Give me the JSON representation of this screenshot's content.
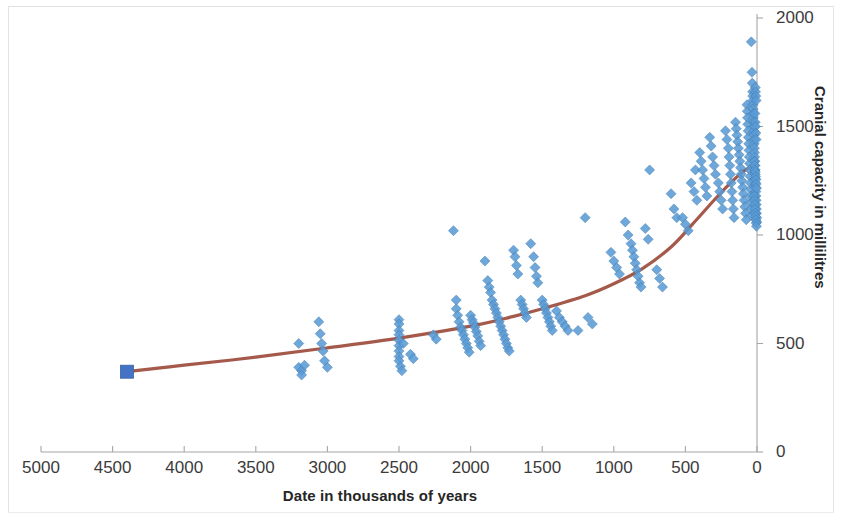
{
  "axes": {
    "x_title": "Date in thousands of years",
    "y_title": "Cranial capacity in millilitres",
    "x_ticks": [
      "5000",
      "4500",
      "4000",
      "3500",
      "3000",
      "2500",
      "2000",
      "1500",
      "1000",
      "500",
      "0"
    ],
    "y_ticks": [
      "0",
      "500",
      "1000",
      "1500",
      "2000"
    ]
  },
  "colors": {
    "marker": "#5B9BD5",
    "marker_edge": "#3E7CB1",
    "trendline": "#9C4B3C",
    "axis_line": "#a6a6a6",
    "tick_text": "#3b3b3b",
    "title_text": "#262626",
    "frame": "#e3e3e3",
    "background": "#ffffff"
  },
  "chart_data": {
    "type": "scatter",
    "title": "",
    "xlabel": "Date in thousands of years",
    "ylabel": "Cranial capacity in millilitres",
    "xlim": [
      5000,
      0
    ],
    "ylim": [
      0,
      2000
    ],
    "x_reversed": true,
    "grid": false,
    "legend": "none",
    "xtick_values": [
      5000,
      4500,
      4000,
      3500,
      3000,
      2500,
      2000,
      1500,
      1000,
      500,
      0
    ],
    "ytick_values": [
      0,
      500,
      1000,
      1500,
      2000
    ],
    "series": [
      {
        "name": "Hominin specimens",
        "marker": "diamond",
        "color": "#5B9BD5",
        "points": [
          [
            4400,
            370
          ],
          [
            3200,
            500
          ],
          [
            3200,
            390
          ],
          [
            3180,
            375
          ],
          [
            3180,
            355
          ],
          [
            3160,
            400
          ],
          [
            3060,
            600
          ],
          [
            3050,
            545
          ],
          [
            3040,
            500
          ],
          [
            3030,
            465
          ],
          [
            3020,
            420
          ],
          [
            3000,
            390
          ],
          [
            2500,
            610
          ],
          [
            2500,
            590
          ],
          [
            2500,
            560
          ],
          [
            2500,
            540
          ],
          [
            2500,
            515
          ],
          [
            2500,
            490
          ],
          [
            2500,
            465
          ],
          [
            2500,
            440
          ],
          [
            2500,
            420
          ],
          [
            2490,
            395
          ],
          [
            2480,
            375
          ],
          [
            2470,
            500
          ],
          [
            2420,
            450
          ],
          [
            2400,
            430
          ],
          [
            2260,
            540
          ],
          [
            2240,
            520
          ],
          [
            2120,
            1020
          ],
          [
            2100,
            700
          ],
          [
            2100,
            660
          ],
          [
            2090,
            630
          ],
          [
            2080,
            600
          ],
          [
            2070,
            575
          ],
          [
            2060,
            560
          ],
          [
            2050,
            540
          ],
          [
            2040,
            520
          ],
          [
            2030,
            500
          ],
          [
            2020,
            480
          ],
          [
            2010,
            460
          ],
          [
            2000,
            630
          ],
          [
            1990,
            610
          ],
          [
            1980,
            595
          ],
          [
            1970,
            575
          ],
          [
            1960,
            555
          ],
          [
            1950,
            535
          ],
          [
            1940,
            510
          ],
          [
            1930,
            490
          ],
          [
            1900,
            880
          ],
          [
            1880,
            790
          ],
          [
            1870,
            760
          ],
          [
            1860,
            735
          ],
          [
            1850,
            700
          ],
          [
            1840,
            680
          ],
          [
            1830,
            660
          ],
          [
            1820,
            640
          ],
          [
            1810,
            620
          ],
          [
            1800,
            600
          ],
          [
            1790,
            580
          ],
          [
            1780,
            560
          ],
          [
            1770,
            540
          ],
          [
            1760,
            520
          ],
          [
            1750,
            500
          ],
          [
            1740,
            480
          ],
          [
            1730,
            465
          ],
          [
            1700,
            930
          ],
          [
            1690,
            900
          ],
          [
            1680,
            860
          ],
          [
            1670,
            820
          ],
          [
            1650,
            700
          ],
          [
            1640,
            680
          ],
          [
            1630,
            660
          ],
          [
            1620,
            640
          ],
          [
            1610,
            620
          ],
          [
            1580,
            960
          ],
          [
            1560,
            900
          ],
          [
            1550,
            850
          ],
          [
            1540,
            810
          ],
          [
            1530,
            780
          ],
          [
            1500,
            700
          ],
          [
            1490,
            680
          ],
          [
            1480,
            660
          ],
          [
            1470,
            640
          ],
          [
            1460,
            620
          ],
          [
            1450,
            600
          ],
          [
            1440,
            580
          ],
          [
            1430,
            560
          ],
          [
            1400,
            650
          ],
          [
            1380,
            620
          ],
          [
            1360,
            600
          ],
          [
            1340,
            580
          ],
          [
            1320,
            560
          ],
          [
            1250,
            560
          ],
          [
            1200,
            1080
          ],
          [
            1180,
            620
          ],
          [
            1150,
            590
          ],
          [
            1020,
            920
          ],
          [
            1000,
            880
          ],
          [
            980,
            850
          ],
          [
            960,
            820
          ],
          [
            920,
            1060
          ],
          [
            900,
            1000
          ],
          [
            880,
            960
          ],
          [
            870,
            930
          ],
          [
            860,
            900
          ],
          [
            850,
            870
          ],
          [
            840,
            840
          ],
          [
            830,
            810
          ],
          [
            820,
            780
          ],
          [
            810,
            760
          ],
          [
            780,
            1030
          ],
          [
            760,
            980
          ],
          [
            750,
            1300
          ],
          [
            700,
            840
          ],
          [
            680,
            800
          ],
          [
            660,
            760
          ],
          [
            600,
            1190
          ],
          [
            580,
            1120
          ],
          [
            560,
            1080
          ],
          [
            520,
            1080
          ],
          [
            500,
            1050
          ],
          [
            480,
            1020
          ],
          [
            460,
            1240
          ],
          [
            440,
            1200
          ],
          [
            430,
            1300
          ],
          [
            420,
            1160
          ],
          [
            400,
            1380
          ],
          [
            390,
            1340
          ],
          [
            380,
            1300
          ],
          [
            370,
            1260
          ],
          [
            360,
            1220
          ],
          [
            350,
            1180
          ],
          [
            330,
            1450
          ],
          [
            320,
            1410
          ],
          [
            310,
            1360
          ],
          [
            300,
            1320
          ],
          [
            290,
            1280
          ],
          [
            270,
            1240
          ],
          [
            260,
            1200
          ],
          [
            250,
            1160
          ],
          [
            240,
            1120
          ],
          [
            220,
            1480
          ],
          [
            210,
            1440
          ],
          [
            200,
            1400
          ],
          [
            195,
            1360
          ],
          [
            190,
            1320
          ],
          [
            185,
            1280
          ],
          [
            180,
            1240
          ],
          [
            175,
            1200
          ],
          [
            170,
            1160
          ],
          [
            165,
            1120
          ],
          [
            160,
            1080
          ],
          [
            150,
            1520
          ],
          [
            145,
            1490
          ],
          [
            140,
            1460
          ],
          [
            135,
            1430
          ],
          [
            130,
            1400
          ],
          [
            125,
            1370
          ],
          [
            120,
            1340
          ],
          [
            115,
            1310
          ],
          [
            110,
            1280
          ],
          [
            105,
            1250
          ],
          [
            100,
            1220
          ],
          [
            95,
            1190
          ],
          [
            90,
            1160
          ],
          [
            85,
            1130
          ],
          [
            80,
            1100
          ],
          [
            75,
            1070
          ],
          [
            70,
            1600
          ],
          [
            68,
            1570
          ],
          [
            66,
            1540
          ],
          [
            64,
            1510
          ],
          [
            62,
            1480
          ],
          [
            60,
            1450
          ],
          [
            58,
            1420
          ],
          [
            56,
            1390
          ],
          [
            54,
            1360
          ],
          [
            52,
            1330
          ],
          [
            50,
            1300
          ],
          [
            48,
            1270
          ],
          [
            46,
            1240
          ],
          [
            44,
            1210
          ],
          [
            42,
            1180
          ],
          [
            40,
            1150
          ],
          [
            38,
            1120
          ],
          [
            36,
            1090
          ],
          [
            40,
            1890
          ],
          [
            35,
            1750
          ],
          [
            33,
            1700
          ],
          [
            31,
            1660
          ],
          [
            30,
            1640
          ],
          [
            29,
            1620
          ],
          [
            28,
            1600
          ],
          [
            27,
            1580
          ],
          [
            26,
            1560
          ],
          [
            25,
            1540
          ],
          [
            24,
            1520
          ],
          [
            23,
            1500
          ],
          [
            22,
            1480
          ],
          [
            21,
            1460
          ],
          [
            20,
            1440
          ],
          [
            19,
            1420
          ],
          [
            18,
            1400
          ],
          [
            17,
            1380
          ],
          [
            16,
            1360
          ],
          [
            15,
            1340
          ],
          [
            14,
            1320
          ],
          [
            13,
            1300
          ],
          [
            12,
            1280
          ],
          [
            11,
            1260
          ],
          [
            10,
            1240
          ],
          [
            9,
            1220
          ],
          [
            8,
            1200
          ],
          [
            7,
            1180
          ],
          [
            6,
            1160
          ],
          [
            5,
            1140
          ],
          [
            4,
            1120
          ],
          [
            3,
            1100
          ],
          [
            2,
            1080
          ],
          [
            1,
            1060
          ],
          [
            12,
            1680
          ],
          [
            10,
            1660
          ],
          [
            8,
            1640
          ],
          [
            6,
            1620
          ],
          [
            14,
            1560
          ],
          [
            12,
            1520
          ],
          [
            10,
            1500
          ],
          [
            8,
            1470
          ],
          [
            6,
            1440
          ],
          [
            18,
            1340
          ],
          [
            16,
            1320
          ],
          [
            14,
            1300
          ],
          [
            12,
            1290
          ],
          [
            10,
            1270
          ],
          [
            8,
            1255
          ],
          [
            6,
            1235
          ],
          [
            4,
            1215
          ],
          [
            20,
            1180
          ],
          [
            18,
            1160
          ],
          [
            16,
            1140
          ],
          [
            14,
            1120
          ],
          [
            12,
            1100
          ],
          [
            10,
            1085
          ],
          [
            8,
            1070
          ],
          [
            6,
            1055
          ],
          [
            4,
            1040
          ]
        ]
      }
    ],
    "trendline": {
      "type": "exponential-fit",
      "color": "#9C4B3C",
      "start_marker": "square",
      "start_point": [
        4400,
        370
      ],
      "path": [
        [
          4400,
          370
        ],
        [
          4000,
          400
        ],
        [
          3500,
          437
        ],
        [
          3000,
          480
        ],
        [
          2500,
          525
        ],
        [
          2000,
          580
        ],
        [
          1700,
          625
        ],
        [
          1500,
          660
        ],
        [
          1200,
          720
        ],
        [
          1000,
          775
        ],
        [
          800,
          845
        ],
        [
          600,
          945
        ],
        [
          450,
          1050
        ],
        [
          300,
          1160
        ],
        [
          200,
          1230
        ],
        [
          100,
          1290
        ],
        [
          40,
          1315
        ],
        [
          0,
          1325
        ]
      ]
    }
  }
}
